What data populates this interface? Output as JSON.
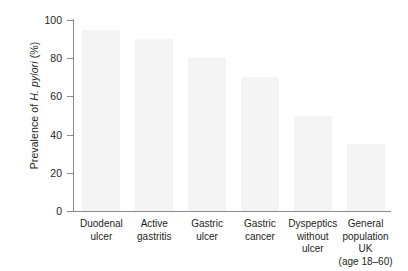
{
  "chart_data": {
    "type": "bar",
    "title": "",
    "xlabel": "",
    "ylabel": "Prevalence of H. pylori (%)",
    "ylabel_parts": {
      "prefix": "Prevalence of ",
      "italic": "H. pylori",
      "suffix": " (%)"
    },
    "categories": [
      "Duodenal\nulcer",
      "Active\ngastritis",
      "Gastric\nulcer",
      "Gastric\ncancer",
      "Dyspeptics\nwithout\nulcer",
      "General\npopulation UK\n(age 18–60)"
    ],
    "values": [
      95,
      90,
      80,
      70,
      50,
      35
    ],
    "ylim": [
      0,
      100
    ],
    "yticks": [
      0,
      20,
      40,
      60,
      80,
      100
    ],
    "ytick_labels": [
      "0",
      "20",
      "40",
      "60",
      "80",
      "100"
    ],
    "grid": false,
    "legend": null,
    "bar_color": "#f4f4f5",
    "axis_color": "#8a8a8d",
    "text_color": "#231f20",
    "background": "#ffffff"
  }
}
